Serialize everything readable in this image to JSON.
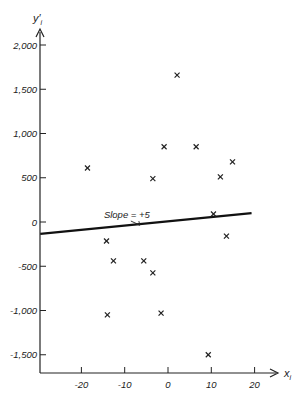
{
  "chart_data": {
    "type": "scatter",
    "title": "",
    "xlabel": "x_i",
    "ylabel": "y'_i",
    "xlim": [
      -30,
      22
    ],
    "ylim": [
      -1750,
      2200
    ],
    "x_ticks": [
      -20,
      -10,
      0,
      10,
      20
    ],
    "x_tick_labels": [
      "-20",
      "-10",
      "0",
      "10",
      "20"
    ],
    "y_ticks": [
      2000,
      1500,
      1000,
      500,
      0,
      -500,
      -1000,
      -1500
    ],
    "y_tick_labels": [
      "2,000",
      "1,500",
      "1,000",
      "500",
      "0",
      "-500",
      "-1,000",
      "-1,500"
    ],
    "grid": false,
    "legend": null,
    "series": [
      {
        "name": "observations",
        "marker": "x",
        "points": [
          {
            "x": -18.6,
            "y": 610
          },
          {
            "x": 2.1,
            "y": 1660
          },
          {
            "x": -0.9,
            "y": 850
          },
          {
            "x": 6.5,
            "y": 850
          },
          {
            "x": 14.9,
            "y": 680
          },
          {
            "x": -3.5,
            "y": 490
          },
          {
            "x": 12.1,
            "y": 510
          },
          {
            "x": 10.5,
            "y": 90
          },
          {
            "x": 13.5,
            "y": -160
          },
          {
            "x": -14.2,
            "y": -215
          },
          {
            "x": -12.6,
            "y": -440
          },
          {
            "x": -5.6,
            "y": -440
          },
          {
            "x": -3.5,
            "y": -575
          },
          {
            "x": -14.0,
            "y": -1050
          },
          {
            "x": -1.6,
            "y": -1030
          },
          {
            "x": 9.3,
            "y": -1500
          }
        ]
      },
      {
        "name": "fitted line",
        "type": "line",
        "points": [
          {
            "x": -29.5,
            "y": -135
          },
          {
            "x": 19.3,
            "y": 100
          }
        ]
      }
    ],
    "annotations": [
      {
        "text": "Slope = +5",
        "x": -9.5,
        "y": 90,
        "arrow_to": {
          "x": -6.5,
          "y": -35
        }
      }
    ]
  }
}
